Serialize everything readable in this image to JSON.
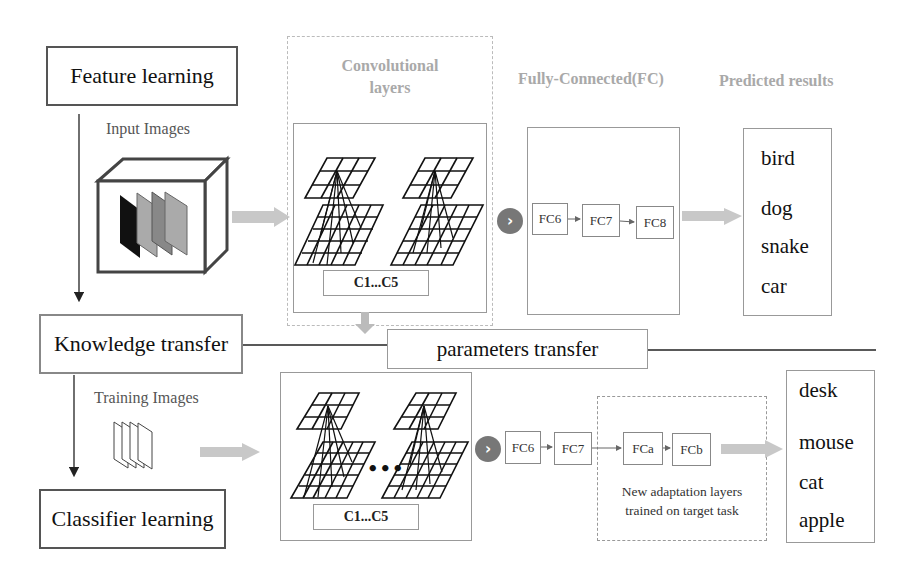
{
  "stages": {
    "feature_learning": "Feature learning",
    "knowledge_transfer": "Knowledge transfer",
    "classifier_learning": "Classifier learning"
  },
  "labels": {
    "input_images": "Input Images",
    "training_images": "Training Images",
    "conv_title_line1": "Convolutional",
    "conv_title_line2": "layers",
    "fc_title": "Fully-Connected(FC)",
    "predicted_title": "Predicted results",
    "parameters_transfer": "parameters transfer",
    "adaptation_line1": "New adaptation layers",
    "adaptation_line2": "trained on target task",
    "conv_range": "C1...C5",
    "ellipsis": "•••"
  },
  "top_fc": [
    "FC6",
    "FC7",
    "FC8"
  ],
  "bottom_fc": [
    "FC6",
    "FC7"
  ],
  "adaptation_fc": [
    "FCa",
    "FCb"
  ],
  "top_results": [
    "bird",
    "dog",
    "snake",
    "car"
  ],
  "bottom_results": [
    "desk",
    "mouse",
    "cat",
    "apple"
  ],
  "icons": {
    "next": "›"
  },
  "colors": {
    "arrow_fill": "#c8c8c8",
    "circle_fill": "#777777",
    "title_gray": "#a9a9a9",
    "border_gray": "#999999"
  }
}
